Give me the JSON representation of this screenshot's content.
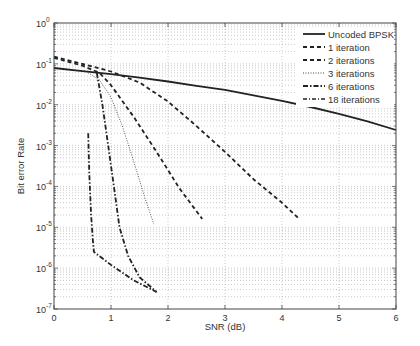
{
  "chart_data": {
    "type": "line",
    "title": "",
    "xlabel": "SNR (dB)",
    "ylabel": "Bit error Rate",
    "xlim": [
      0,
      6
    ],
    "ylim": [
      1e-07,
      1
    ],
    "yscale": "log",
    "grid": true,
    "legend_position": "upper right",
    "x_ticks": [
      "0",
      "1",
      "2",
      "3",
      "4",
      "5",
      "6"
    ],
    "y_ticks": [
      "10^0",
      "10^-1",
      "10^-2",
      "10^-3",
      "10^-4",
      "10^-5",
      "10^-6",
      "10^-7"
    ],
    "series": [
      {
        "name": "Uncoded BPSK",
        "style": "solid",
        "x": [
          0,
          0.5,
          1,
          1.5,
          2,
          2.5,
          3,
          3.5,
          4,
          4.5,
          5,
          5.5,
          6
        ],
        "y": [
          0.079,
          0.066,
          0.056,
          0.046,
          0.037,
          0.029,
          0.023,
          0.017,
          0.0125,
          0.0088,
          0.006,
          0.0039,
          0.0024
        ]
      },
      {
        "name": "1 iteration",
        "style": "dashed",
        "x": [
          0,
          0.5,
          1,
          1.5,
          2,
          2.5,
          3,
          3.5,
          4,
          4.3
        ],
        "y": [
          0.15,
          0.1,
          0.065,
          0.035,
          0.012,
          0.003,
          0.0007,
          0.00015,
          4e-05,
          1.6e-05
        ]
      },
      {
        "name": "2 iterations",
        "style": "dashed",
        "x": [
          0,
          0.5,
          0.8,
          1.0,
          1.4,
          1.8,
          2.2,
          2.6
        ],
        "y": [
          0.14,
          0.09,
          0.06,
          0.03,
          0.005,
          0.0007,
          9e-05,
          1.6e-05
        ]
      },
      {
        "name": "3 iterations",
        "style": "dotted",
        "x": [
          0.6,
          0.8,
          1.0,
          1.2,
          1.4,
          1.6,
          1.75
        ],
        "y": [
          0.06,
          0.04,
          0.015,
          0.003,
          0.0004,
          5e-05,
          1.2e-05
        ]
      },
      {
        "name": "6 iterations",
        "style": "dash-dot",
        "x": [
          0.75,
          0.85,
          0.95,
          1.05,
          1.15,
          1.3,
          1.5,
          1.8
        ],
        "y": [
          0.06,
          0.01,
          0.001,
          0.0001,
          1e-05,
          2e-06,
          6e-07,
          2.6e-07
        ]
      },
      {
        "name": "18 iterations",
        "style": "dash-dot",
        "x": [
          0.6,
          0.62,
          0.65,
          0.68,
          0.7,
          1.0,
          1.4,
          1.8
        ],
        "y": [
          0.002,
          0.0002,
          2e-05,
          5e-06,
          2.5e-06,
          1.2e-06,
          5e-07,
          2.6e-07
        ]
      }
    ]
  },
  "legend": {
    "items": [
      {
        "label": "Uncoded BPSK"
      },
      {
        "label": "1 iteration"
      },
      {
        "label": "2 iterations"
      },
      {
        "label": "3 iterations"
      },
      {
        "label": "6 iterations"
      },
      {
        "label": "18 iterations"
      }
    ]
  },
  "axes": {
    "xlabel": "SNR (dB)",
    "ylabel": "Bit error Rate",
    "x_ticks": [
      "0",
      "1",
      "2",
      "3",
      "4",
      "5",
      "6"
    ],
    "y_exponents": [
      "0",
      "-1",
      "-2",
      "-3",
      "-4",
      "-5",
      "-6",
      "-7"
    ]
  }
}
